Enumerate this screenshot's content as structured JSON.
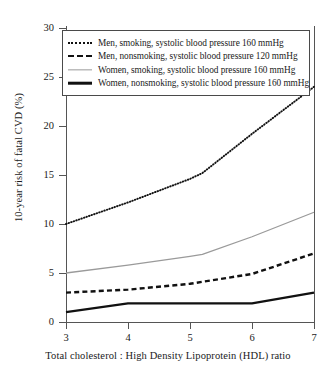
{
  "chart_data": {
    "type": "line",
    "title": "",
    "xlabel": "Total cholesterol : High Density Lipoprotein (HDL) ratio",
    "ylabel": "10-year risk of fatal CVD (%)",
    "xlim": [
      3,
      7
    ],
    "ylim": [
      0,
      30
    ],
    "xticks": [
      3,
      4,
      5,
      6,
      7
    ],
    "yticks": [
      0,
      5,
      10,
      15,
      20,
      25,
      30
    ],
    "grid": false,
    "legend_position": "upper-left",
    "x": [
      3,
      4,
      5,
      5.2,
      6,
      7
    ],
    "series": [
      {
        "name": "Men, smoking, systolic blood pressure 160 mmHg",
        "style": "dotted",
        "color": "#111111",
        "values": [
          10.0,
          12.2,
          14.6,
          15.2,
          19.2,
          24.0
        ]
      },
      {
        "name": "Men, nonsmoking, systolic blood pressure 120 mmHg",
        "style": "dashed",
        "color": "#111111",
        "values": [
          3.0,
          3.3,
          3.9,
          4.1,
          4.9,
          7.0
        ]
      },
      {
        "name": "Women, smoking, systolic blood pressure 160 mmHg",
        "style": "solid-grey",
        "color": "#9a9a9a",
        "values": [
          5.0,
          5.8,
          6.7,
          6.9,
          8.7,
          11.2
        ]
      },
      {
        "name": "Women, nonsmoking, systolic blood pressure 160 mmHg",
        "style": "solid",
        "color": "#111111",
        "values": [
          1.0,
          1.9,
          1.9,
          1.9,
          1.9,
          3.0
        ]
      }
    ]
  },
  "legend": {
    "entries": [
      {
        "label": "Men, smoking, systolic blood pressure 160 mmHg"
      },
      {
        "label": "Men, nonsmoking, systolic blood pressure 120 mmHg"
      },
      {
        "label": "Women, smoking, systolic blood pressure 160 mmHg"
      },
      {
        "label": "Women, nonsmoking, systolic blood pressure 160 mmHg"
      }
    ]
  },
  "axes": {
    "y_tick_labels": [
      "30",
      "25",
      "20",
      "15",
      "10",
      "5",
      "0"
    ],
    "x_tick_labels": [
      "3",
      "4",
      "5",
      "6",
      "7"
    ]
  }
}
